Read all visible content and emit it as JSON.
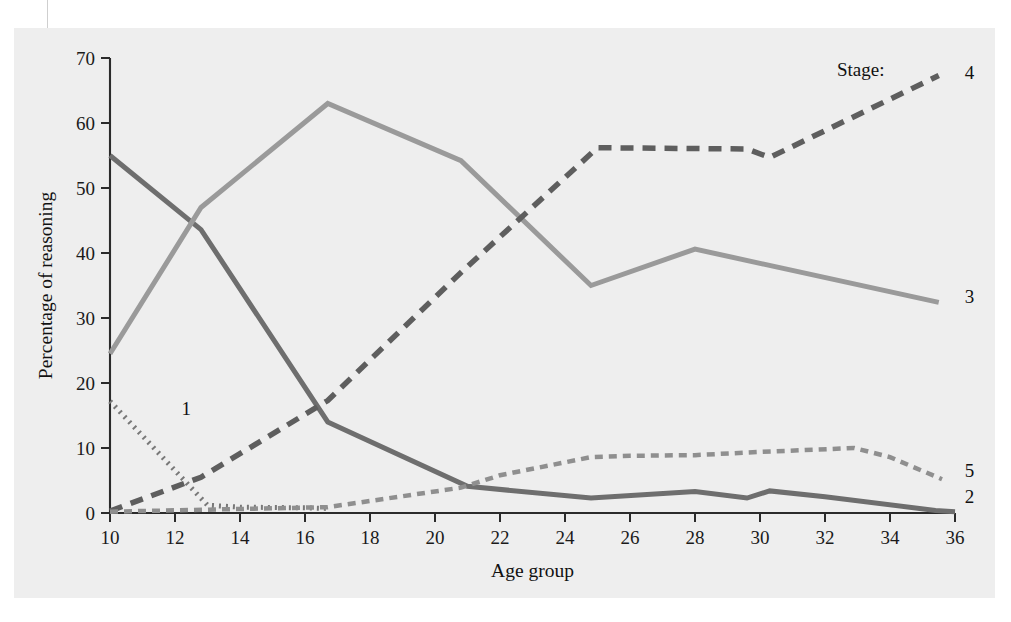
{
  "figure": {
    "background_color": "#eeeeee",
    "legend_prefix": "Stage:"
  },
  "chart_data": {
    "type": "line",
    "title": "",
    "xlabel": "Age group",
    "ylabel": "Percentage of reasoning",
    "xlim": [
      10,
      36
    ],
    "ylim": [
      0,
      70
    ],
    "xticks": [
      10,
      12,
      14,
      16,
      18,
      20,
      22,
      24,
      26,
      28,
      30,
      32,
      34,
      36
    ],
    "yticks": [
      0,
      10,
      20,
      30,
      40,
      50,
      60,
      70
    ],
    "grid": false,
    "legend_position": "line-end-labels",
    "legend_title": "Stage:",
    "series": [
      {
        "name": "1",
        "label": "1",
        "color": "#787878",
        "style": "dotted",
        "stroke_width": 5,
        "dash": "2 5",
        "label_x": 12.2,
        "label_y": 16.2,
        "x": [
          10,
          13,
          14,
          16,
          16.7
        ],
        "y": [
          17.2,
          1.2,
          0.9,
          0.8,
          0.7
        ]
      },
      {
        "name": "2",
        "label": "2",
        "color": "#6e6e6e",
        "style": "solid",
        "stroke_width": 5,
        "dash": "",
        "label_x": 36.3,
        "label_y": 2.6,
        "x": [
          10,
          12.8,
          16.7,
          21,
          24.8,
          28,
          29.6,
          30.3,
          32,
          35.4,
          36
        ],
        "y": [
          55.0,
          43.6,
          14.0,
          4.1,
          2.3,
          3.3,
          2.3,
          3.4,
          2.5,
          0.4,
          0.2
        ]
      },
      {
        "name": "3",
        "label": "3",
        "color": "#9a9a9a",
        "style": "solid",
        "stroke_width": 5,
        "dash": "",
        "label_x": 36.3,
        "label_y": 33.4,
        "x": [
          10,
          12.8,
          16.7,
          20.8,
          24.8,
          28,
          35.5
        ],
        "y": [
          24.5,
          47.0,
          63.0,
          54.2,
          35.0,
          40.6,
          32.4
        ]
      },
      {
        "name": "4",
        "label": "4",
        "color": "#5e5e5e",
        "style": "dashed",
        "stroke_width": 5.5,
        "dash": "13 9",
        "label_x": 36.3,
        "label_y": 67.8,
        "x": [
          10,
          12.8,
          16.7,
          20.8,
          25,
          29.6,
          30.3,
          35.5
        ],
        "y": [
          0.3,
          5.5,
          17.3,
          37.0,
          56.2,
          56.0,
          54.7,
          67.3
        ]
      },
      {
        "name": "5",
        "label": "5",
        "color": "#8f8f8f",
        "style": "dashed-fine",
        "stroke_width": 4.5,
        "dash": "8 6",
        "label_x": 36.3,
        "label_y": 6.6,
        "x": [
          10,
          16.7,
          20.8,
          22,
          24.8,
          26,
          28,
          30,
          32.9,
          34,
          35.6
        ],
        "y": [
          0.2,
          0.9,
          3.9,
          5.8,
          8.6,
          8.8,
          8.9,
          9.4,
          10.0,
          8.6,
          5.2
        ]
      }
    ]
  }
}
